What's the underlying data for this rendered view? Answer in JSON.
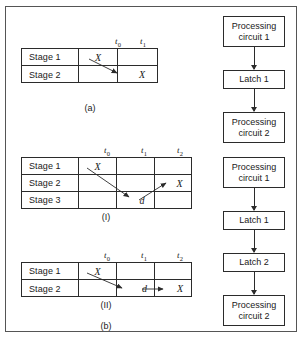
{
  "diagram": {
    "left_panel": {
      "tables": [
        {
          "id": "table-a",
          "caption": "(a)",
          "col_headers": [
            {
              "base": "t",
              "sub": "0"
            },
            {
              "base": "t",
              "sub": "1"
            }
          ],
          "rows": [
            {
              "stage": "Stage 1",
              "cells": [
                "X",
                ""
              ]
            },
            {
              "stage": "Stage 2",
              "cells": [
                "",
                "X"
              ]
            }
          ],
          "arrows": [
            {
              "from": "stage1-t0",
              "to": "stage2-t1",
              "label": ""
            }
          ]
        },
        {
          "id": "table-i",
          "caption": "(I)",
          "col_headers": [
            {
              "base": "t",
              "sub": "0"
            },
            {
              "base": "t",
              "sub": "1"
            },
            {
              "base": "t",
              "sub": "2"
            }
          ],
          "rows": [
            {
              "stage": "Stage 1",
              "cells": [
                "X",
                "",
                ""
              ]
            },
            {
              "stage": "Stage 2",
              "cells": [
                "",
                "",
                "X"
              ]
            },
            {
              "stage": "Stage 3",
              "cells": [
                "",
                "d",
                ""
              ]
            }
          ],
          "arrows": [
            {
              "from": "stage1-t0",
              "to": "stage3-t1",
              "label": "d"
            },
            {
              "from": "stage3-t1",
              "to": "stage2-t2",
              "label": "X"
            }
          ]
        },
        {
          "id": "table-ii",
          "caption": "(II)",
          "col_headers": [
            {
              "base": "t",
              "sub": "0"
            },
            {
              "base": "t",
              "sub": "1"
            },
            {
              "base": "t",
              "sub": "2"
            }
          ],
          "rows": [
            {
              "stage": "Stage 1",
              "cells": [
                "X",
                "",
                ""
              ]
            },
            {
              "stage": "Stage 2",
              "cells": [
                "",
                "d",
                "X"
              ]
            }
          ],
          "arrows": [
            {
              "from": "stage1-t0",
              "to": "stage2-t1",
              "label": "d"
            },
            {
              "from": "stage2-t1",
              "to": "stage2-t2",
              "label": "X"
            }
          ]
        }
      ],
      "group_caption": "(b)"
    },
    "right_panel": {
      "chains": [
        {
          "id": "chain-top",
          "nodes": [
            {
              "lines": [
                "Processing",
                "circuit 1"
              ],
              "type": "processing"
            },
            {
              "lines": [
                "Latch 1"
              ],
              "type": "latch"
            },
            {
              "lines": [
                "Processing",
                "circuit 2"
              ],
              "type": "processing"
            }
          ]
        },
        {
          "id": "chain-bottom",
          "nodes": [
            {
              "lines": [
                "Processing",
                "circuit 1"
              ],
              "type": "processing"
            },
            {
              "lines": [
                "Latch 1"
              ],
              "type": "latch"
            },
            {
              "lines": [
                "Latch 2"
              ],
              "type": "latch"
            },
            {
              "lines": [
                "Processing",
                "circuit 2"
              ],
              "type": "processing"
            }
          ]
        }
      ]
    },
    "colors": {
      "line": "#2b2b2b",
      "frame": "#555555",
      "background": "#ffffff"
    }
  }
}
